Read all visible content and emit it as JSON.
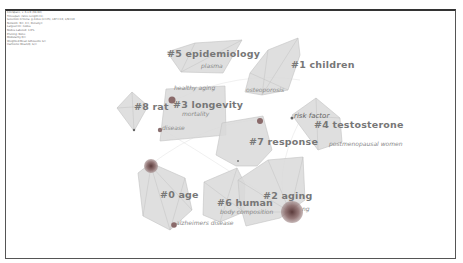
{
  "header_metadata": [
    "CiteSpace, v. 6.x.R (64-bit)",
    "Timespan: (Slice Length=1)",
    "Selection Criteria: g-index (k=25), LRF=3.0, L/N=10",
    "Network: N=, E=, Density=",
    "Largest CC: nodes",
    "Nodes Labeled: 1.0%",
    "Pruning: None",
    "Modularity Q=",
    "Weighted Mean Silhouette S=",
    "Harmonic Mean(Q, S)="
  ],
  "clusters": [
    {
      "id": "0",
      "label": "#0 age",
      "x": 160,
      "y": 197
    },
    {
      "id": "1",
      "label": "#1 children",
      "x": 292,
      "y": 63
    },
    {
      "id": "2",
      "label": "#2 aging",
      "x": 263,
      "y": 194
    },
    {
      "id": "3",
      "label": "#3 longevity",
      "x": 173,
      "y": 104
    },
    {
      "id": "4",
      "label": "#4 testosterone",
      "x": 314,
      "y": 123
    },
    {
      "id": "5",
      "label": "#5 epidemiology",
      "x": 201,
      "y": 54
    },
    {
      "id": "6",
      "label": "#6 human",
      "x": 217,
      "y": 200
    },
    {
      "id": "7",
      "label": "#7 response",
      "x": 249,
      "y": 139
    },
    {
      "id": "8",
      "label": "#8 rat",
      "x": 132,
      "y": 106
    }
  ],
  "keywords": [
    {
      "label": "plasma",
      "x": 201,
      "y": 66
    },
    {
      "label": "osteoporosis",
      "x": 246,
      "y": 89
    },
    {
      "label": "healthy aging",
      "x": 174,
      "y": 87
    },
    {
      "label": "mortality",
      "x": 182,
      "y": 113
    },
    {
      "label": "disease",
      "x": 160,
      "y": 126
    },
    {
      "label": "risk factor",
      "x": 293,
      "y": 115
    },
    {
      "label": "postmenopausal women",
      "x": 329,
      "y": 143
    },
    {
      "label": "body composition",
      "x": 220,
      "y": 212
    },
    {
      "label": "alzheimers disease",
      "x": 175,
      "y": 222
    },
    {
      "label": "ng",
      "x": 302,
      "y": 209
    }
  ],
  "colors": {
    "hull_fill": "#d8d8d8",
    "hull_stroke": "#bdbdbd",
    "label": "#7a7a7a",
    "node": "#8a6a6a",
    "node_big": "#6e4e4e"
  }
}
